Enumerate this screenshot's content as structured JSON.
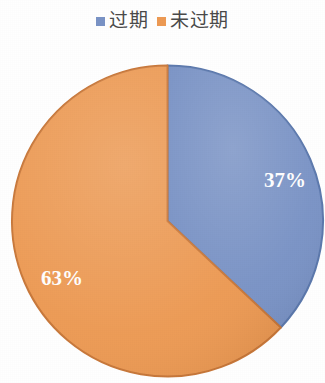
{
  "chart_data": {
    "type": "pie",
    "title": "",
    "subtitle": "",
    "xlabel": "",
    "ylabel": "",
    "grid": false,
    "legend_position": "top-center",
    "start_angle_deg": 0,
    "direction": "clockwise",
    "categories": [
      "过期",
      "未过期"
    ],
    "values": [
      37,
      63
    ],
    "unit": "%",
    "data_labels": [
      "37%",
      "63%"
    ],
    "colors": [
      "#7A93C6",
      "#ED9A54"
    ],
    "slices": [
      {
        "name": "过期",
        "value": 37,
        "label": "37%",
        "color": "#7A93C6",
        "edge_color": "#5C79AD",
        "label_color": "#FFFFFF"
      },
      {
        "name": "未过期",
        "value": 63,
        "label": "63%",
        "color": "#ED9A54",
        "edge_color": "#C9783A",
        "label_color": "#FFFFFF"
      }
    ]
  },
  "legend": {
    "items": [
      {
        "label": "过期",
        "color": "#7A93C6",
        "swatch_icon": "square-swatch-icon"
      },
      {
        "label": "未过期",
        "color": "#ED9A54",
        "swatch_icon": "square-swatch-icon"
      }
    ]
  },
  "labels": {
    "slice_0": "37%",
    "slice_1": "63%"
  },
  "colors": {
    "expired": "#7A93C6",
    "not_expired": "#ED9A54",
    "background": "#FFFFFF",
    "legend_text": "#4A4A4A",
    "label_text": "#FFFFFF"
  }
}
